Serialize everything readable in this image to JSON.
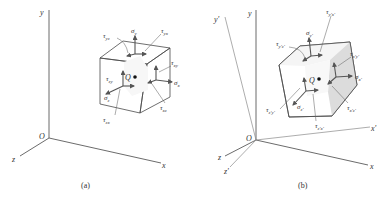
{
  "figures": [
    {
      "caption": "(a)",
      "origin_label": "O",
      "point_label": "Q",
      "axes": {
        "x": "x",
        "y": "y",
        "z": "z"
      },
      "stress_labels": {
        "sigma_y": "σ",
        "sigma_y_sub": "y",
        "tau_yz": "τ",
        "tau_yz_sub": "yz",
        "tau_yx": "τ",
        "tau_yx_sub": "yx",
        "tau_xy": "τ",
        "tau_xy_sub": "xy",
        "sigma_x": "σ",
        "sigma_x_sub": "x",
        "tau_xz": "τ",
        "tau_xz_sub": "xz",
        "tau_zy": "τ",
        "tau_zy_sub": "zy",
        "sigma_z": "σ",
        "sigma_z_sub": "z",
        "tau_zx": "τ",
        "tau_zx_sub": "zx"
      }
    },
    {
      "caption": "(b)",
      "origin_label": "O",
      "point_label": "Q",
      "axes": {
        "x": "x",
        "y": "y",
        "z": "z",
        "xp": "x'",
        "yp": "y'",
        "zp": "z'"
      },
      "stress_labels": {
        "sigma_y": "σ",
        "sigma_y_sub": "y'",
        "tau_yz": "τ",
        "tau_yz_sub": "y'z'",
        "tau_yx": "τ",
        "tau_yx_sub": "y'x'",
        "tau_xy": "τ",
        "tau_xy_sub": "x'y'",
        "sigma_x": "σ",
        "sigma_x_sub": "x'",
        "tau_xz": "τ",
        "tau_xz_sub": "x'z'",
        "tau_zy": "τ",
        "tau_zy_sub": "z'y'",
        "sigma_z": "σ",
        "sigma_z_sub": "z'",
        "tau_zx": "τ",
        "tau_zx_sub": "z'x'"
      }
    }
  ],
  "colors": {
    "cube_front": "#ececec",
    "cube_top": "#f4f4f4",
    "cube_side": "#dedede",
    "line": "#4a4a4a"
  }
}
